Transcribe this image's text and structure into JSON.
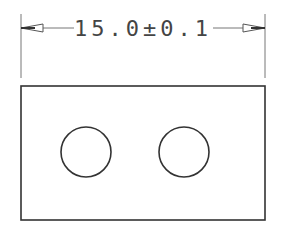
{
  "drawing": {
    "type": "technical-drawing",
    "view": "front",
    "dimension": {
      "label": "15.0±0.1",
      "nominal": 15.0,
      "tolerance": "±0.1"
    },
    "part": {
      "shape": "rectangle",
      "holes": [
        {
          "id": "hole-left"
        },
        {
          "id": "hole-right"
        }
      ]
    },
    "colors": {
      "line": "#333333",
      "dimension_line": "#666666",
      "background": "#ffffff"
    }
  }
}
